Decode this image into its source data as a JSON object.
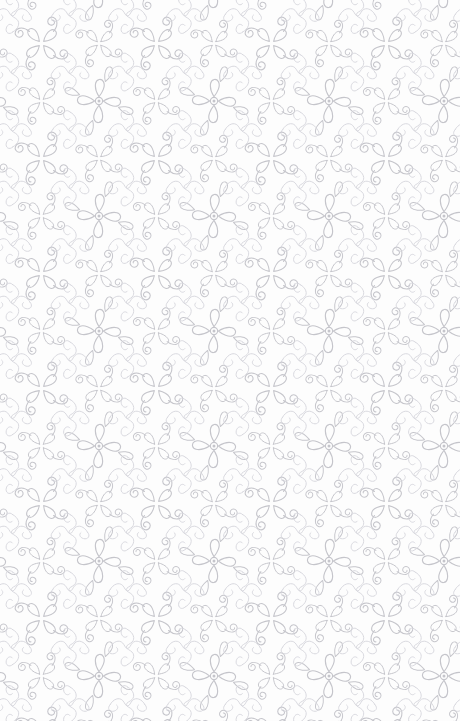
{
  "canvas": {
    "width": 460,
    "height": 721,
    "background_color": "#fdfdfd",
    "description": "Seamless ornamental flourish wallpaper pattern"
  },
  "pattern": {
    "name": "damask-flourish-seamless",
    "tile_width": 115,
    "tile_height": 115,
    "stroke_color": "#c5c5cb",
    "stroke_color_light": "#d6d6dc",
    "stroke_width": 1.15,
    "dot_color": "#bdbdc4",
    "motifs": [
      {
        "name": "dotted-petal-cross",
        "description": "Four teardrop petals radiating from a small ringed center dot with outer loop terminals",
        "petal_count": 4,
        "has_center_dot": true,
        "center_ring_radius": 3.6,
        "center_dot_radius": 1.5
      },
      {
        "name": "spiral-arm-cross",
        "description": "Four curved arms terminating in rolled spiral curls arranged on the diagonals",
        "arm_count": 4,
        "has_center_dot": false
      }
    ],
    "repeat_mode": "seamless-grid",
    "columns": 4,
    "rows": 7
  }
}
